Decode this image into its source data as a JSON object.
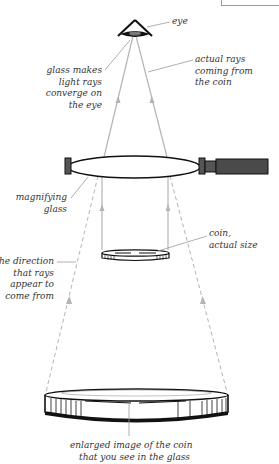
{
  "diagram": {
    "colors": {
      "ray": "#b4b4b4",
      "outline": "#1a1a1a",
      "handle": "#4a4a4a",
      "label_text": "#333333",
      "leader_line": "#9a9a9a"
    },
    "labels": {
      "eye": {
        "lines": [
          "eye"
        ]
      },
      "actual_rays": {
        "lines": [
          "actual rays",
          "coming from",
          "the coin"
        ]
      },
      "glass_makes": {
        "lines": [
          "glass makes",
          "light rays",
          "converge on",
          "the eye"
        ]
      },
      "magnifying_glass": {
        "lines": [
          "magnifying",
          "glass"
        ]
      },
      "coin_actual": {
        "lines": [
          "coin,",
          "actual size"
        ]
      },
      "direction": {
        "lines": [
          "the direction",
          "that rays",
          "appear to",
          "come from"
        ]
      },
      "enlarged": {
        "lines": [
          "enlarged image of the coin",
          "that you see in the glass"
        ]
      }
    },
    "components": [
      {
        "name": "eye",
        "icon": "eye-icon"
      },
      {
        "name": "magnifying-glass",
        "icon": "lens-icon"
      },
      {
        "name": "coin-actual",
        "icon": "coin-icon"
      },
      {
        "name": "coin-enlarged-image",
        "icon": "coin-icon"
      },
      {
        "name": "actual-rays",
        "style": "solid"
      },
      {
        "name": "apparent-rays",
        "style": "dashed"
      }
    ]
  }
}
